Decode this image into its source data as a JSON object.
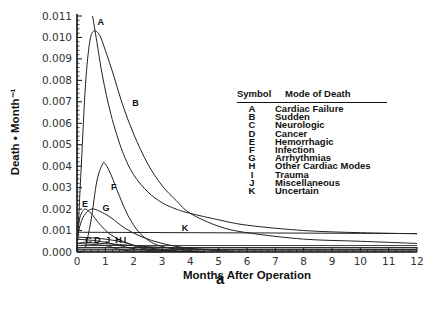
{
  "chart_data": {
    "type": "line",
    "title": "",
    "xlabel": "Months After Operation",
    "ylabel": "Death • Month⁻¹",
    "xlim": [
      0,
      12
    ],
    "ylim": [
      0,
      0.011
    ],
    "xticks": [
      "0",
      "1",
      "2",
      "3",
      "4",
      "5",
      "6",
      "7",
      "8",
      "9",
      "10",
      "11",
      "12"
    ],
    "yticks": [
      "0.000",
      "0.001",
      "0.002",
      "0.003",
      "0.004",
      "0.005",
      "0.006",
      "0.007",
      "0.008",
      "0.009",
      "0.010",
      "0.011"
    ],
    "grid": false,
    "legend_position": "right-center (table)",
    "series": [
      {
        "name": "A",
        "mode": "Cardiac Failure",
        "x": [
          0.55,
          0.7,
          0.9,
          1.2,
          1.6,
          2.0,
          2.5,
          3.0,
          3.5,
          4.0,
          5,
          6,
          8,
          10,
          12
        ],
        "y": [
          0.011,
          0.0098,
          0.0082,
          0.0064,
          0.0047,
          0.0036,
          0.0028,
          0.0023,
          0.002,
          0.0018,
          0.0015,
          0.00125,
          0.001,
          0.0009,
          0.00085
        ]
      },
      {
        "name": "B",
        "mode": "Sudden",
        "x": [
          0,
          0.15,
          0.3,
          0.45,
          0.6,
          0.8,
          1.0,
          1.3,
          1.6,
          2.0,
          2.5,
          3.0,
          3.5,
          4.0,
          5,
          6,
          8,
          10,
          12
        ],
        "y": [
          0,
          0.004,
          0.0078,
          0.0098,
          0.0103,
          0.0101,
          0.0094,
          0.0082,
          0.0069,
          0.0055,
          0.0041,
          0.0031,
          0.0024,
          0.0018,
          0.0012,
          0.0009,
          0.0006,
          0.0005,
          0.0004
        ]
      },
      {
        "name": "C",
        "mode": "Neurologic",
        "x": [
          0,
          0.3,
          0.8,
          1.5,
          2.5,
          4,
          6,
          12
        ],
        "y": [
          0.0004,
          0.00045,
          0.0004,
          0.00035,
          0.00025,
          0.00015,
          0.0001,
          0.0001
        ]
      },
      {
        "name": "D",
        "mode": "Cancer",
        "x": [
          0,
          12
        ],
        "y": [
          0.0002,
          0.0002
        ]
      },
      {
        "name": "E",
        "mode": "Hemorrhagic",
        "x": [
          0,
          0.05,
          0.1,
          0.2,
          0.3,
          0.5,
          0.8,
          1.2,
          1.8,
          2.5,
          3.5
        ],
        "y": [
          0.0008,
          0.0012,
          0.0016,
          0.0019,
          0.002,
          0.0018,
          0.0013,
          0.0008,
          0.0004,
          0.0002,
          5e-05
        ]
      },
      {
        "name": "F",
        "mode": "Infection",
        "x": [
          0.3,
          0.5,
          0.7,
          0.9,
          1.0,
          1.2,
          1.5,
          1.8,
          2.2,
          2.7,
          3.2,
          3.8,
          4.5
        ],
        "y": [
          0.0002,
          0.0015,
          0.0033,
          0.0041,
          0.0041,
          0.0036,
          0.0026,
          0.0017,
          0.0009,
          0.0004,
          0.0002,
          8e-05,
          2e-05
        ]
      },
      {
        "name": "G",
        "mode": "Arrhythmias",
        "x": [
          0,
          0.1,
          0.25,
          0.5,
          0.8,
          1.2,
          1.7,
          2.3,
          3.0,
          3.8,
          4.6,
          5.5
        ],
        "y": [
          0.0005,
          0.0012,
          0.0017,
          0.002,
          0.0019,
          0.0016,
          0.0011,
          0.0007,
          0.0004,
          0.0002,
          0.0001,
          3e-05
        ]
      },
      {
        "name": "H",
        "mode": "Other Cardiac Modes",
        "x": [
          0,
          0.8,
          1.5,
          2.0,
          2.5,
          3.2,
          4.5
        ],
        "y": [
          0.0006,
          0.0005,
          0.0003,
          0.00015,
          8e-05,
          3e-05,
          1e-05
        ]
      },
      {
        "name": "I",
        "mode": "Trauma",
        "x": [
          0,
          1.0,
          1.8,
          2.2,
          2.8,
          3.5,
          4.5
        ],
        "y": [
          0.0007,
          0.0006,
          0.0004,
          0.0002,
          0.0001,
          4e-05,
          1e-05
        ]
      },
      {
        "name": "J",
        "mode": "Miscellaneous",
        "x": [
          0,
          1.0,
          1.4,
          1.8,
          2.3,
          3.0
        ],
        "y": [
          0.0004,
          0.0003,
          0.00015,
          6e-05,
          2e-05,
          0.0
        ]
      },
      {
        "name": "K",
        "mode": "Uncertain",
        "x": [
          0,
          2,
          4,
          6,
          8,
          10,
          12
        ],
        "y": [
          0.00092,
          0.00091,
          0.0009,
          0.00089,
          0.00088,
          0.00087,
          0.00086
        ]
      }
    ],
    "curve_labels": [
      {
        "text": "A",
        "x": 0.72,
        "y": 0.0106
      },
      {
        "text": "B",
        "x": 1.95,
        "y": 0.0068
      },
      {
        "text": "F",
        "x": 1.2,
        "y": 0.0029
      },
      {
        "text": "G",
        "x": 0.9,
        "y": 0.0019
      },
      {
        "text": "E",
        "x": 0.18,
        "y": 0.0021
      },
      {
        "text": "C",
        "x": 0.28,
        "y": 0.0004
      },
      {
        "text": "D",
        "x": 0.6,
        "y": 0.0004
      },
      {
        "text": "J",
        "x": 1.0,
        "y": 0.0004
      },
      {
        "text": "H",
        "x": 1.35,
        "y": 0.0004
      },
      {
        "text": "I",
        "x": 1.65,
        "y": 0.0004
      },
      {
        "text": "K",
        "x": 3.7,
        "y": 0.001
      }
    ]
  },
  "legend": {
    "header_symbol": "Symbol",
    "header_mode": "Mode of Death",
    "rows": [
      {
        "sym": "A",
        "mode": "Cardiac Failure"
      },
      {
        "sym": "B",
        "mode": "Sudden"
      },
      {
        "sym": "C",
        "mode": "Neurologic"
      },
      {
        "sym": "D",
        "mode": "Cancer"
      },
      {
        "sym": "E",
        "mode": "Hemorrhagic"
      },
      {
        "sym": "F",
        "mode": "Infection"
      },
      {
        "sym": "G",
        "mode": "Arrhythmias"
      },
      {
        "sym": "H",
        "mode": "Other Cardiac Modes"
      },
      {
        "sym": "I",
        "mode": "Trauma"
      },
      {
        "sym": "J",
        "mode": "Miscellaneous"
      },
      {
        "sym": "K",
        "mode": "Uncertain"
      }
    ]
  },
  "panel_label": "a"
}
